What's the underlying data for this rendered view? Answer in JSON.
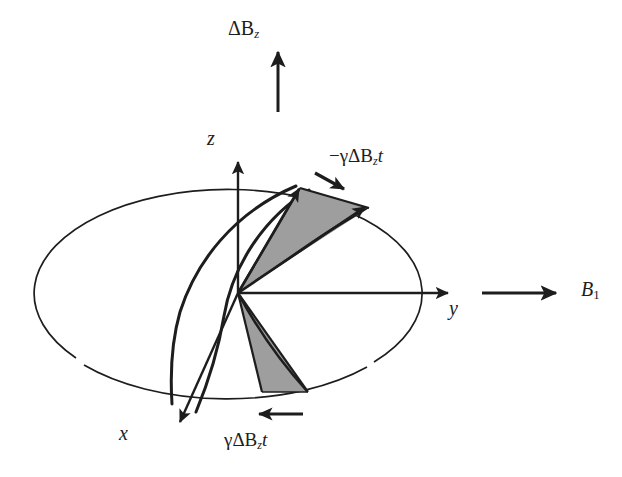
{
  "figure": {
    "kind": "bloch-sphere-precession-diagram",
    "caption_absent": true,
    "background_color": "#ffffff",
    "ink_color": "#1d1d1d",
    "wedge_fill_color": "#9e9e9e",
    "wedge_stroke_color": "#1d1d1d"
  },
  "axes": {
    "x": {
      "label": "x",
      "label_markup": "x",
      "direction": "down-left",
      "tip": [
        178,
        425
      ],
      "origin": [
        238,
        293
      ]
    },
    "y": {
      "label": "y",
      "label_markup": "y",
      "direction": "right",
      "tip": [
        452,
        293
      ],
      "origin": [
        238,
        293
      ]
    },
    "z": {
      "label": "z",
      "label_markup": "z",
      "direction": "up",
      "tip": [
        238,
        158
      ],
      "origin": [
        238,
        293
      ]
    }
  },
  "fields": {
    "delta_bz": {
      "label": "ΔB",
      "subscript": "z",
      "full_label": "ΔB_z",
      "arrow": {
        "from": [
          278,
          110
        ],
        "to": [
          278,
          48
        ]
      },
      "position": "top-center"
    },
    "b1": {
      "label": "B",
      "subscript": "1",
      "full_label": "B_1",
      "arrow": {
        "from": [
          480,
          293
        ],
        "to": [
          560,
          293
        ]
      },
      "position": "right-center"
    }
  },
  "annotations": {
    "upper": {
      "label_prefix": "−γΔB",
      "subscript": "z",
      "label_suffix": "t",
      "full_label": "−γΔB_z t",
      "arrow_direction": "down-right",
      "arrow": {
        "from": [
          316,
          174
        ],
        "to": [
          348,
          191
        ]
      }
    },
    "lower": {
      "label_prefix": "γΔB",
      "subscript": "z",
      "label_suffix": "t",
      "full_label": "γΔB_z t",
      "arrow_direction": "left",
      "arrow": {
        "from": [
          303,
          414
        ],
        "to": [
          255,
          414
        ]
      }
    }
  },
  "sphere": {
    "equator_ellipse": {
      "cx": 232,
      "cy": 290,
      "rx": 194,
      "ry": 104
    },
    "gaps": [
      {
        "at": [
          78,
          360
        ],
        "note": "lower-left rim break"
      },
      {
        "at": [
          375,
          363
        ],
        "note": "lower-right rim break"
      }
    ]
  },
  "wedges": {
    "upper": {
      "name": "upper-precession-wedge",
      "apex": [
        238,
        293
      ],
      "vector_tips": [
        [
          300,
          188
        ],
        [
          369,
          208
        ]
      ],
      "fill": "#9e9e9e"
    },
    "lower": {
      "name": "lower-precession-wedge",
      "apex": [
        238,
        293
      ],
      "vector_tips": [
        [
          265,
          390
        ],
        [
          305,
          392
        ]
      ],
      "fill": "#9e9e9e"
    }
  }
}
